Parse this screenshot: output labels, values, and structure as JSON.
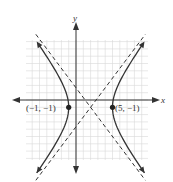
{
  "diagram": {
    "type": "hyperbola-graph",
    "axes": {
      "x_label": "x",
      "y_label": "y"
    },
    "points": [
      {
        "label": "(−1, −1)",
        "x": -1,
        "y": -1
      },
      {
        "label": "(5, −1)",
        "x": 5,
        "y": -1
      }
    ],
    "curve": {
      "center": [
        2,
        -1
      ],
      "a": 3,
      "b": 4,
      "orientation": "horizontal"
    },
    "asymptotes": [
      {
        "slope": 1.333,
        "through": [
          2,
          -1
        ],
        "style": "dashed"
      },
      {
        "slope": -1.333,
        "through": [
          2,
          -1
        ],
        "style": "dashed"
      }
    ],
    "colors": {
      "grid": "#d9d9d9",
      "axis": "#333333",
      "curve": "#333333",
      "asymptote": "#333333",
      "point": "#222222"
    }
  }
}
